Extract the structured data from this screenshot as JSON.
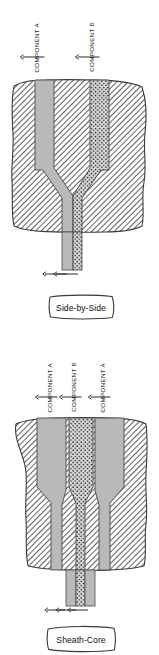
{
  "diagram": {
    "colors": {
      "component_a_fill": "#b9b9b9",
      "component_b_fill": "#d8d8d8",
      "component_b_dots": "#1a1a1a",
      "block_hatch": "#2b2b2b",
      "block_fill": "#ffffff",
      "outline": "#3a3a3a",
      "arrow": "#2a2a2a",
      "text": "#111111"
    },
    "units": "px"
  },
  "panels": [
    {
      "id": "side-by-side",
      "inlet_labels": [
        {
          "text": "COMPONENT A",
          "component": "A"
        },
        {
          "text": "COMPONENT B",
          "component": "B"
        }
      ],
      "inlet_count": 2,
      "outlet_arrow_count": 2,
      "callout": {
        "label": "Side-by-Side"
      }
    },
    {
      "id": "sheath-core",
      "inlet_labels": [
        {
          "text": "COMPONENT A",
          "component": "A"
        },
        {
          "text": "COMPONENT B",
          "component": "B"
        },
        {
          "text": "COMPONENT A",
          "component": "A"
        }
      ],
      "inlet_count": 3,
      "outlet_arrow_count": 3,
      "callout": {
        "label": "Sheath-Core"
      }
    }
  ]
}
